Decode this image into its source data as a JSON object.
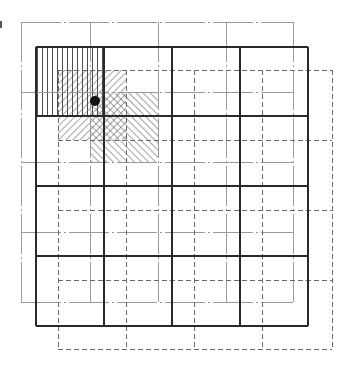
{
  "canvas": {
    "width": 351,
    "height": 367,
    "background": "#ffffff"
  },
  "grids": [
    {
      "id": "gray-grid",
      "style": "solid-thin",
      "color": "#9a9a9a",
      "stroke_width": 1,
      "dash": "40 3 2 3",
      "x": [
        21,
        90,
        158,
        226,
        293
      ],
      "y": [
        22,
        92,
        162,
        232,
        302
      ]
    },
    {
      "id": "dashed-grid",
      "style": "dashed",
      "color": "#6a6a6a",
      "stroke_width": 1,
      "dash": "5 3",
      "x": [
        58,
        126,
        194,
        262,
        332
      ],
      "y": [
        70,
        140,
        210,
        280,
        349
      ]
    },
    {
      "id": "black-grid",
      "style": "solid-thick",
      "color": "#2a2a2a",
      "stroke_width": 1.6,
      "dash": "",
      "x": [
        36,
        104,
        172,
        240,
        308
      ],
      "y": [
        47,
        116,
        186,
        256,
        326
      ]
    }
  ],
  "hatched_cells": [
    {
      "id": "black-cell-vertical",
      "pattern": "vertical",
      "x": 36,
      "y": 47,
      "w": 68,
      "h": 69,
      "color": "#3a3a3a",
      "spacing": 5
    },
    {
      "id": "dashed-cell-forward",
      "pattern": "forward-diagonal",
      "x": 58,
      "y": 70,
      "w": 68,
      "h": 70,
      "color": "#4a4a4a",
      "spacing": 5
    },
    {
      "id": "gray-cell-backward",
      "pattern": "backward-diagonal",
      "x": 90,
      "y": 92,
      "w": 68,
      "h": 70,
      "color": "#4a4a4a",
      "spacing": 5
    }
  ],
  "point": {
    "cx": 95,
    "cy": 101,
    "r": 5,
    "color": "#111111"
  },
  "artifacts": [
    {
      "x": 0,
      "y": 21,
      "w": 2,
      "h": 7
    }
  ]
}
